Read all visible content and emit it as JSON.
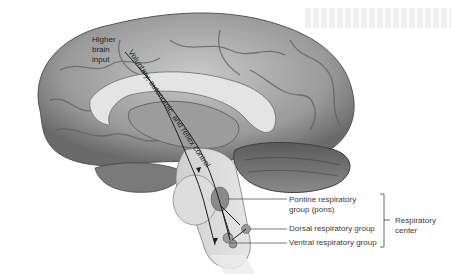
{
  "figure": {
    "colors": {
      "background": "#ffffff",
      "brain_tissue_light": "#d9d9d9",
      "brain_tissue_mid": "#a8a8a8",
      "brain_tissue_dark": "#6e6e6e",
      "pathway_line": "#1e1e1e",
      "label_text": "#3a3a3a"
    }
  },
  "labels": {
    "higher_brain_input": [
      "Higher",
      "brain",
      "input"
    ],
    "pathway": "Voluntary, autonomic, and reflex control",
    "pontine": [
      "Pontine respiratory",
      "group (pons)"
    ],
    "dorsal": "Dorsal respiratory group",
    "ventral": "Ventral respiratory group",
    "respiratory_center": [
      "Respiratory",
      "center"
    ]
  }
}
